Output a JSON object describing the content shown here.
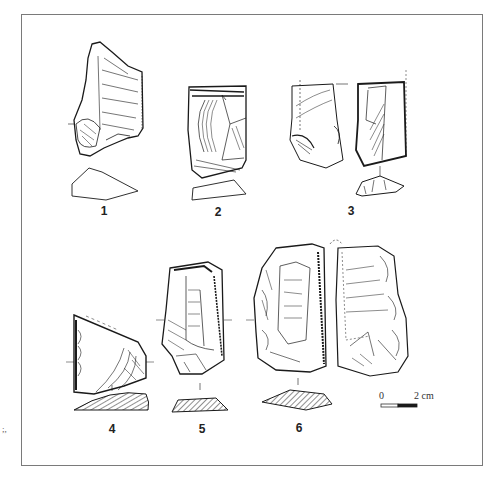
{
  "figure": {
    "artifacts": [
      {
        "number": "1",
        "label": "1",
        "section": "outline"
      },
      {
        "number": "2",
        "label": "2",
        "section": "outline"
      },
      {
        "number": "3",
        "label": "3",
        "section": "outline",
        "views": 2
      },
      {
        "number": "4",
        "label": "4",
        "section": "hatched"
      },
      {
        "number": "5",
        "label": "5",
        "section": "hatched"
      },
      {
        "number": "6",
        "label": "6",
        "section": "hatched",
        "views": 2
      }
    ],
    "scale_bar": {
      "start_label": "0",
      "end_label": "2 cm"
    },
    "edge_mark": ";,"
  },
  "colors": {
    "ink": "#1a1a1a",
    "frame": "#7a7a7a",
    "background": "#ffffff"
  }
}
